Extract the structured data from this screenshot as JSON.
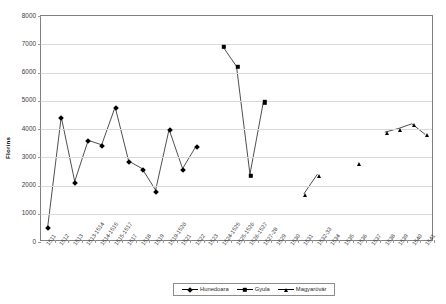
{
  "chart_data": {
    "type": "line",
    "title": "",
    "xlabel": "",
    "ylabel": "Florins",
    "ylim": [
      0,
      8000
    ],
    "ytick_step": 1000,
    "yticks": [
      "0",
      "1000",
      "2000",
      "3000",
      "4000",
      "5000",
      "6000",
      "7000",
      "8000"
    ],
    "grid": true,
    "legend_position": "bottom",
    "categories": [
      "1511",
      "1512",
      "1513",
      "1513-1514",
      "1514-1515",
      "1515-1517",
      "1517",
      "1518",
      "1519",
      "1519-1520",
      "1521",
      "1522",
      "1523",
      "1524-1525",
      "1525-1526",
      "1526-1527",
      "1527-28",
      "1529",
      "1530",
      "1531",
      "1532-33",
      "1534",
      "1535",
      "1536",
      "1537",
      "1538",
      "1539",
      "1540",
      "1541"
    ],
    "series": [
      {
        "name": "Hunedoara",
        "marker": "diamond",
        "color": "#000000",
        "values": [
          480,
          4400,
          2090,
          3560,
          3400,
          4750,
          2820,
          2550,
          1780,
          3950,
          2550,
          3350,
          null,
          null,
          null,
          null,
          null,
          null,
          null,
          null,
          null,
          null,
          null,
          null,
          null,
          null,
          null,
          null,
          null
        ]
      },
      {
        "name": "Gyula",
        "marker": "square",
        "color": "#000000",
        "values": [
          null,
          null,
          null,
          null,
          null,
          null,
          null,
          null,
          null,
          null,
          null,
          null,
          null,
          6900,
          6200,
          2350,
          4950,
          null,
          null,
          null,
          null,
          null,
          null,
          null,
          null,
          null,
          null,
          null,
          null
        ]
      },
      {
        "name": "Magyaróvár",
        "marker": "triangle",
        "color": "#000000",
        "values": [
          null,
          null,
          null,
          null,
          null,
          null,
          null,
          null,
          null,
          null,
          null,
          null,
          null,
          null,
          null,
          null,
          null,
          null,
          null,
          1650,
          2350,
          null,
          null,
          2750,
          null,
          3850,
          3980,
          4150,
          3770
        ]
      }
    ]
  },
  "legend": {
    "entries": [
      {
        "label": "Hunedoara",
        "marker": "diamond"
      },
      {
        "label": "Gyula",
        "marker": "square"
      },
      {
        "label": "Magyaróvár",
        "marker": "triangle"
      }
    ]
  },
  "axis": {
    "y_title": "Florins"
  }
}
